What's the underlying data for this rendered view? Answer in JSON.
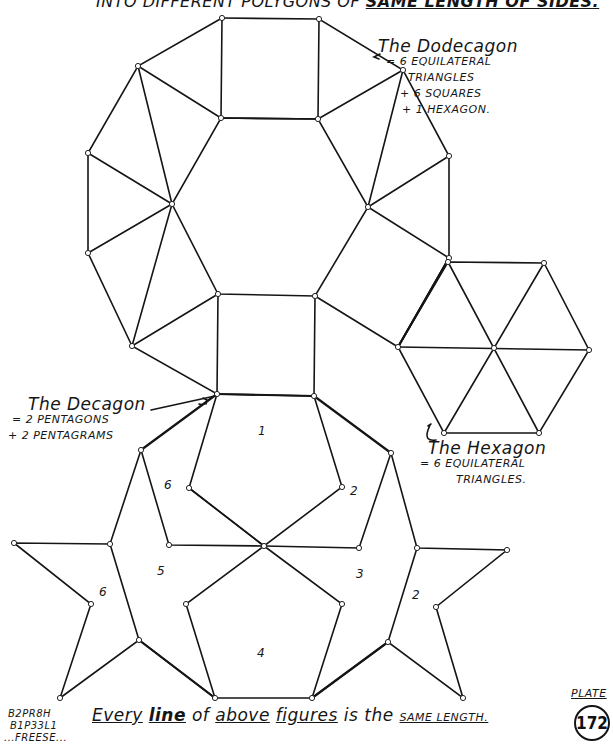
{
  "header": {
    "title_prefix": "INTO DIFFERENT POLYGONS OF ",
    "title_emphasis": "SAME LENGTH OF SIDES."
  },
  "labels": {
    "dodecagon": {
      "name": "The Dodecagon",
      "line1": "= 6 EQUILATERAL",
      "line2": "TRIANGLES",
      "line3": "+ 6 SQUARES",
      "line4": "+ 1 HEXAGON."
    },
    "hexagon": {
      "name": "The Hexagon",
      "line1": "= 6 EQUILATERAL",
      "line2": "TRIANGLES."
    },
    "decagon": {
      "name": "The Decagon",
      "line1": "= 2 PENTAGONS",
      "line2": "+ 2 PENTAGRAMS"
    }
  },
  "region_numbers": [
    {
      "text": "1",
      "x": 262,
      "y": 432
    },
    {
      "text": "6",
      "x": 168,
      "y": 486
    },
    {
      "text": "2",
      "x": 354,
      "y": 492
    },
    {
      "text": "6",
      "x": 103,
      "y": 593
    },
    {
      "text": "5",
      "x": 161,
      "y": 572
    },
    {
      "text": "3",
      "x": 360,
      "y": 575
    },
    {
      "text": "2",
      "x": 416,
      "y": 596
    },
    {
      "text": "4",
      "x": 261,
      "y": 654
    }
  ],
  "footer": {
    "w1": "Every",
    "w2": "line",
    "w3": "of",
    "w4": "above",
    "w5": "figures",
    "w6": "is the",
    "w7": "SAME LENGTH."
  },
  "code": {
    "line1": "B2PR8H",
    "line2": "B1P33L1",
    "line3": "...FREESE..."
  },
  "plate": {
    "label": "PLATE",
    "number": "172"
  },
  "colors": {
    "ink": "#151515",
    "paper": "#ffffff"
  },
  "geometry": {
    "vertices": {
      "D1": [
        222,
        18
      ],
      "D2": [
        319,
        19
      ],
      "D3": [
        403,
        70
      ],
      "D4": [
        449,
        156
      ],
      "D5": [
        449,
        258
      ],
      "D6": [
        398,
        347
      ],
      "D7": [
        314,
        396
      ],
      "D8": [
        217,
        394
      ],
      "D9": [
        132,
        346
      ],
      "D10": [
        88,
        253
      ],
      "D11": [
        88,
        153
      ],
      "D12": [
        138,
        66
      ],
      "S1": [
        221,
        118
      ],
      "S2": [
        318,
        119
      ],
      "H1": [
        368,
        207
      ],
      "H2": [
        315,
        296
      ],
      "H3": [
        218,
        294
      ],
      "H4": [
        172,
        204
      ],
      "X1": [
        498,
        262
      ],
      "X2": [
        589,
        311
      ],
      "X3": [
        544,
        399
      ],
      "X4": [
        448,
        399
      ],
      "X5": [
        494,
        348
      ],
      "P1": [
        141,
        450
      ],
      "P2": [
        189,
        488
      ],
      "P3": [
        110,
        544
      ],
      "P4": [
        169,
        545
      ],
      "P5": [
        14,
        543
      ],
      "P6": [
        91,
        604
      ],
      "P7": [
        139,
        640
      ],
      "P8": [
        60,
        698
      ],
      "P9": [
        215,
        698
      ],
      "P10": [
        312,
        698
      ],
      "C": [
        264,
        546
      ],
      "Q1": [
        342,
        487
      ],
      "Q2": [
        391,
        453
      ],
      "Q3": [
        359,
        548
      ],
      "Q4": [
        417,
        548
      ],
      "Q5": [
        507,
        550
      ],
      "Q6": [
        436,
        607
      ],
      "Q7": [
        342,
        604
      ],
      "Q8": [
        388,
        642
      ],
      "Q9": [
        463,
        698
      ],
      "R1": [
        186,
        604
      ]
    }
  }
}
